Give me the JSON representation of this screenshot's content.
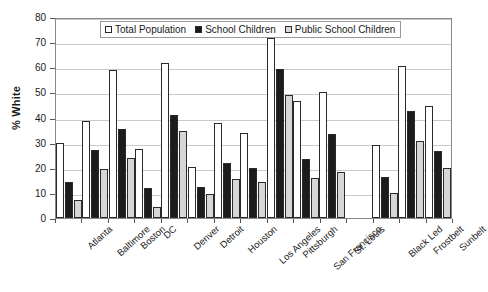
{
  "chart_data": {
    "type": "bar",
    "title": "",
    "xlabel": "",
    "ylabel": "% White",
    "ylim": [
      0,
      80
    ],
    "ytick_step": 10,
    "yticks": [
      0,
      10,
      20,
      30,
      40,
      50,
      60,
      70,
      80
    ],
    "grid": true,
    "legend_position": "top-center-inside",
    "categories": [
      "Atlanta",
      "Baltimore",
      "Boston",
      "DC",
      "Denver",
      "Detroit",
      "Houston",
      "Los Angeles",
      "Pittsburgh",
      "San Francisco",
      "St. Louis",
      "",
      "Black Led",
      "Frostbelt",
      "Sunbelt"
    ],
    "series": [
      {
        "name": "Total Population",
        "fill": "white",
        "values": [
          30,
          38.5,
          59,
          27.5,
          61.5,
          20.5,
          38,
          34,
          71.5,
          46.5,
          50,
          null,
          29,
          60.5,
          44.5
        ]
      },
      {
        "name": "School Children",
        "fill": "black",
        "values": [
          14.5,
          27,
          35.5,
          12,
          41,
          12.5,
          22,
          20,
          59.5,
          23.5,
          33.5,
          null,
          16.5,
          42.5,
          26.5
        ]
      },
      {
        "name": "Public School Children",
        "fill": "light-gray-dotted",
        "values": [
          7,
          19.5,
          24,
          4.5,
          34.5,
          9.5,
          15.5,
          14.5,
          49,
          16,
          18.5,
          null,
          10,
          30.5,
          20
        ]
      }
    ]
  },
  "colors": {
    "series_total_population": "#ffffff",
    "series_school_children": "#1c1c1c",
    "series_public_school_children": "#d6d6d6",
    "gridline": "#c9c9c9",
    "axis": "#888888",
    "text": "#1a1a1a",
    "background": "#ffffff"
  }
}
